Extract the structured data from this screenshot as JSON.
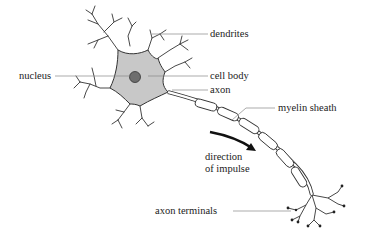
{
  "diagram": {
    "labels": {
      "dendrites": "dendrites",
      "nucleus": "nucleus",
      "cell_body": "cell body",
      "axon": "axon",
      "myelin_sheath": "myelin sheath",
      "direction_line1": "direction",
      "direction_line2": "of impulse",
      "axon_terminals": "axon terminals"
    },
    "colors": {
      "cell_body_fill": "#c8c8c8",
      "nucleus_fill": "#6e6e6e",
      "stroke": "#333333",
      "leader_line": "#888888",
      "arrow": "#111111"
    }
  }
}
